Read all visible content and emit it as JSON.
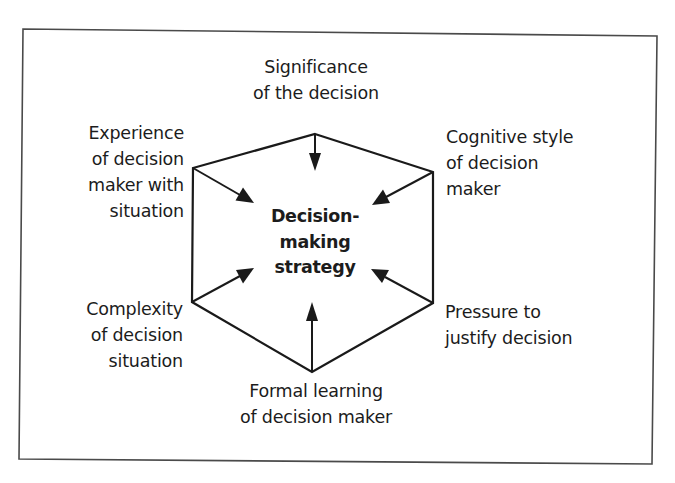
{
  "diagram": {
    "type": "hexagon-influence-diagram",
    "center": {
      "lines": [
        "Decision-",
        "making",
        "strategy"
      ]
    },
    "factors": {
      "top": {
        "lines": [
          "Significance",
          "of the decision"
        ]
      },
      "upper_left": {
        "lines": [
          "Experience",
          "of decision",
          "maker with",
          "situation"
        ]
      },
      "upper_right": {
        "lines": [
          "Cognitive style",
          "of decision",
          "maker"
        ]
      },
      "lower_left": {
        "lines": [
          "Complexity",
          "of decision",
          "situation"
        ]
      },
      "lower_right": {
        "lines": [
          "Pressure to",
          "justify decision"
        ]
      },
      "bottom": {
        "lines": [
          "Formal learning",
          "of decision maker"
        ]
      }
    },
    "colors": {
      "stroke": "#1a1a1a",
      "frame": "#4a4a4a",
      "text": "#1c1c1c",
      "background": "#ffffff"
    }
  }
}
